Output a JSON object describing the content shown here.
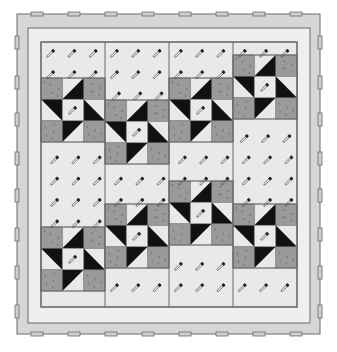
{
  "illustration": {
    "subject": "Quilt top with safety-pin basting",
    "colors": {
      "background": "#ffffff",
      "outer_border": "#d6d6d6",
      "inner_border": "#efefef",
      "light_fabric": "#e9e9e9",
      "medium_fabric": "#9a9a9a",
      "dark_fabric": "#111111",
      "line": "#6a6a6a",
      "tab_fill": "#cfcfcf"
    },
    "frame": {
      "x": 17,
      "y": 14,
      "w": 303,
      "h": 320
    },
    "inner_border": {
      "x": 28,
      "y": 28,
      "w": 282,
      "h": 295
    },
    "center": {
      "x": 41,
      "y": 42,
      "w": 256,
      "h": 265
    },
    "block_size": 64,
    "top_tabs_x": [
      31,
      68,
      105,
      142,
      179,
      216,
      253,
      290
    ],
    "side_tabs_y": [
      36,
      76,
      113,
      152,
      189,
      228,
      266,
      305
    ],
    "bottom_tabs_x": [
      31,
      68,
      105,
      142,
      179,
      216,
      253,
      290
    ],
    "columns": [
      {
        "x": 41,
        "stars_y": [
          78,
          227
        ]
      },
      {
        "x": 105,
        "stars_y": [
          100,
          204
        ]
      },
      {
        "x": 169,
        "stars_y": [
          78,
          181
        ]
      },
      {
        "x": 233,
        "stars_y": [
          55,
          204
        ]
      }
    ],
    "pin_icon": "safety-pin-icon"
  }
}
